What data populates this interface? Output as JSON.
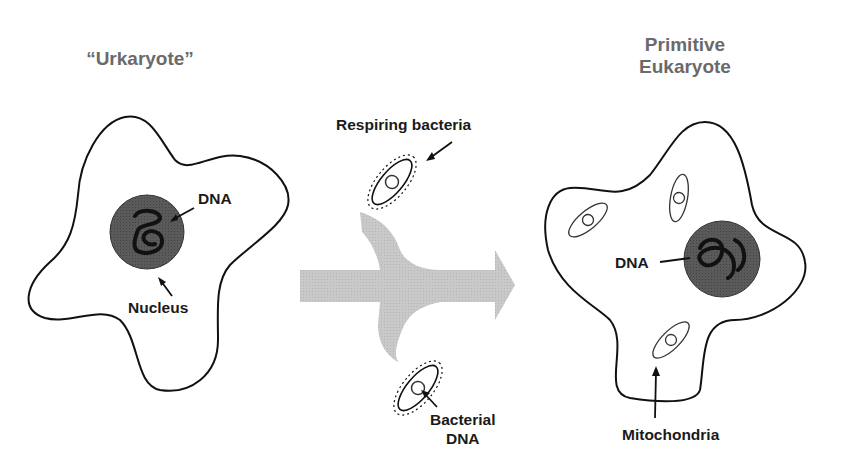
{
  "titles": {
    "left": "“Urkaryote”",
    "right_line1": "Primitive",
    "right_line2": "Eukaryote"
  },
  "labels": {
    "left_dna": "DNA",
    "nucleus": "Nucleus",
    "respiring_bacteria": "Respiring bacteria",
    "bacterial_dna_line1": "Bacterial",
    "bacterial_dna_line2": "DNA",
    "right_dna": "DNA",
    "mitochondria": "Mitochondria"
  },
  "colors": {
    "title": "#6a6a6a",
    "outline": "#111111",
    "nucleus_fill": "#555555",
    "arrow_fill": "#c8c8c8"
  }
}
